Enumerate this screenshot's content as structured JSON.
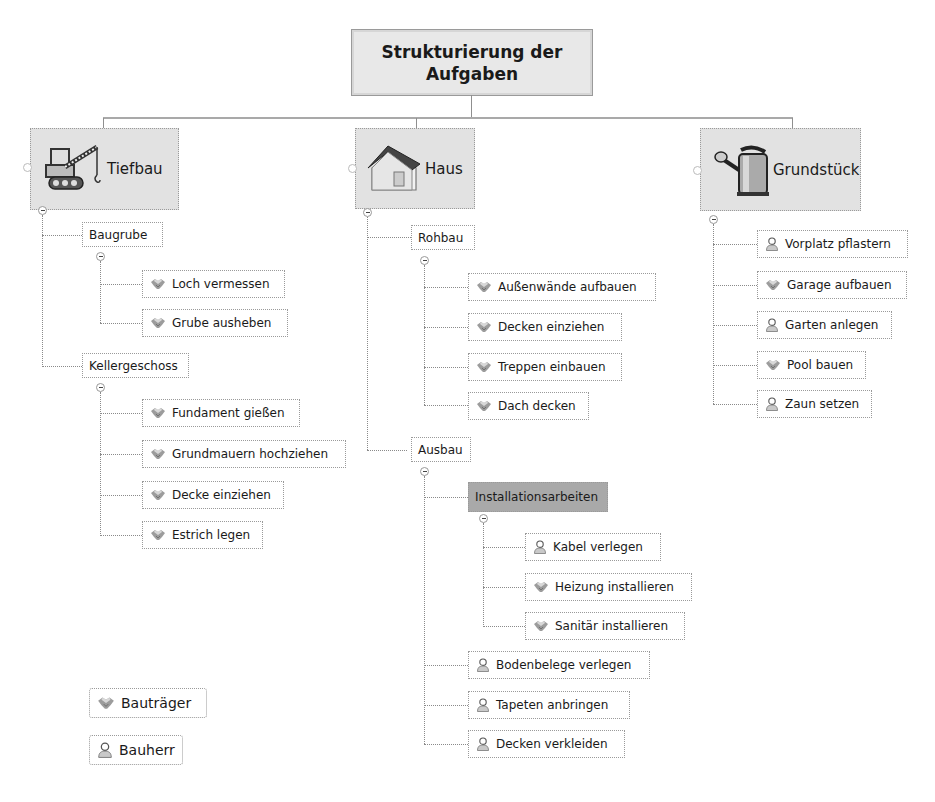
{
  "root": {
    "line1": "Strukturierung der",
    "line2": "Aufgaben"
  },
  "branches": {
    "tiefbau": {
      "label": "Tiefbau",
      "icon": "crane-icon",
      "groups": [
        {
          "label": "Baugrube",
          "items": [
            {
              "label": "Loch vermessen",
              "role": "bautraeger"
            },
            {
              "label": "Grube ausheben",
              "role": "bautraeger"
            }
          ]
        },
        {
          "label": "Kellergeschoss",
          "items": [
            {
              "label": "Fundament gießen",
              "role": "bautraeger"
            },
            {
              "label": "Grundmauern hochziehen",
              "role": "bautraeger"
            },
            {
              "label": "Decke einziehen",
              "role": "bautraeger"
            },
            {
              "label": "Estrich legen",
              "role": "bautraeger"
            }
          ]
        }
      ]
    },
    "haus": {
      "label": "Haus",
      "icon": "house-icon",
      "groups": [
        {
          "label": "Rohbau",
          "items": [
            {
              "label": "Außenwände aufbauen",
              "role": "bautraeger"
            },
            {
              "label": "Decken einziehen",
              "role": "bautraeger"
            },
            {
              "label": "Treppen einbauen",
              "role": "bautraeger"
            },
            {
              "label": "Dach decken",
              "role": "bautraeger"
            }
          ]
        },
        {
          "label": "Ausbau",
          "subgroup": {
            "label": "Installationsarbeiten",
            "items": [
              {
                "label": "Kabel verlegen",
                "role": "bauherr"
              },
              {
                "label": "Heizung installieren",
                "role": "bautraeger"
              },
              {
                "label": "Sanitär installieren",
                "role": "bautraeger"
              }
            ]
          },
          "items": [
            {
              "label": "Bodenbelege verlegen",
              "role": "bauherr"
            },
            {
              "label": "Tapeten anbringen",
              "role": "bauherr"
            },
            {
              "label": "Decken verkleiden",
              "role": "bauherr"
            }
          ]
        }
      ]
    },
    "grundstueck": {
      "label": "Grundstück",
      "icon": "watering-can-icon",
      "items": [
        {
          "label": "Vorplatz pflastern",
          "role": "bauherr"
        },
        {
          "label": "Garage aufbauen",
          "role": "bautraeger"
        },
        {
          "label": "Garten anlegen",
          "role": "bauherr"
        },
        {
          "label": "Pool bauen",
          "role": "bautraeger"
        },
        {
          "label": "Zaun setzen",
          "role": "bauherr"
        }
      ]
    }
  },
  "legend": [
    {
      "label": "Bauträger",
      "icon": "handshake-icon"
    },
    {
      "label": "Bauherr",
      "icon": "person-icon"
    }
  ],
  "colors": {
    "main_fill": "#e2e2e2",
    "highlight_fill": "#a9a9a9",
    "border": "#9a9a9a"
  }
}
